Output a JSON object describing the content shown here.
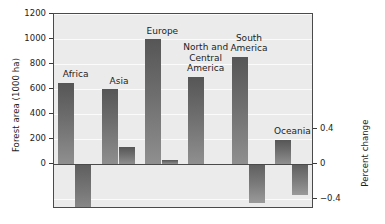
{
  "chart_data": {
    "type": "bar",
    "title": "",
    "xlabel": "",
    "ylabel": "Forest area (1000 ha)",
    "y2label": "Percent change",
    "categories": [
      "Africa",
      "Asia",
      "Europe",
      "North and\nCentral\nAmerica",
      "South\nAmerica",
      "Oceania"
    ],
    "series": [
      {
        "name": "Forest area (1000 ha)",
        "axis": "left",
        "values": [
          650,
          600,
          1000,
          700,
          860,
          195
        ]
      },
      {
        "name": "Percent change",
        "axis": "right",
        "values": [
          -0.7,
          0.2,
          0.05,
          0.0,
          -0.45,
          -0.35
        ]
      }
    ],
    "ylim": [
      -0.8,
      1200
    ],
    "y_ticks": [
      0,
      200,
      400,
      600,
      800,
      1000,
      1200
    ],
    "y_ticklabels": [
      "0",
      "200",
      "400",
      "600",
      "800",
      "1000",
      "1200"
    ],
    "y2lim": [
      -0.8,
      0.4
    ],
    "y2_ticks": [
      0.4,
      0,
      -0.4,
      -0.8
    ],
    "y2_ticklabels": [
      "0.4",
      "0",
      "−0.4",
      "−0.8"
    ],
    "grid": true,
    "legend": "none",
    "plot_background": "#ebebeb",
    "bar_color_top": "#565656",
    "bar_color_bottom": "#8f8f8f",
    "frame_color": "#4a4a4a"
  }
}
